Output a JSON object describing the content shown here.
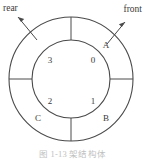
{
  "figure": {
    "title_caption": "图 1-13   架结构体",
    "direction_labels": {
      "rear": "rear",
      "front": "front"
    },
    "outer_ring_labels": {
      "upper_right": "A",
      "lower_right": "B",
      "lower_left": "C"
    },
    "inner_labels": {
      "upper_right": "0",
      "lower_right": "1",
      "lower_left": "2",
      "upper_left": "3"
    },
    "geometry": {
      "center_x": 71,
      "center_y": 79,
      "outer_radius": 62,
      "inner_radius": 39,
      "divider_angles_deg": [
        0,
        90,
        180,
        270
      ]
    },
    "colors": {
      "stroke": "#4a4a4a",
      "text": "#3a3a3a",
      "caption": "#8c8c8c",
      "background": "#ffffff"
    }
  }
}
